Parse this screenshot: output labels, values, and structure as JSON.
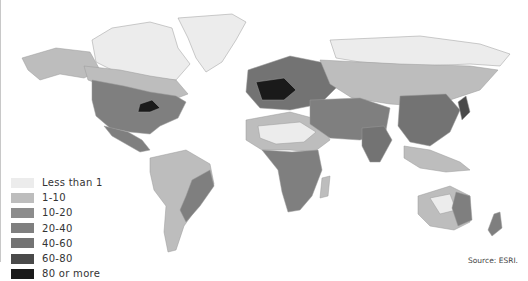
{
  "map": {
    "type": "choropleth-world-map",
    "subject": "population density"
  },
  "legend": {
    "items": [
      {
        "label": "Less than 1",
        "color": "#ececec",
        "key": "c0"
      },
      {
        "label": "1-10",
        "color": "#bdbdbd",
        "key": "c1"
      },
      {
        "label": "10-20",
        "color": "#8c8c8c",
        "key": "c2"
      },
      {
        "label": "20-40",
        "color": "#7f7f7f",
        "key": "c3"
      },
      {
        "label": "40-60",
        "color": "#737373",
        "key": "c4"
      },
      {
        "label": "60-80",
        "color": "#4a4a4a",
        "key": "c5"
      },
      {
        "label": "80 or more",
        "color": "#1a1a1a",
        "key": "c6"
      }
    ]
  },
  "regions": [
    {
      "name": "greenland",
      "class": "c0"
    },
    {
      "name": "canada-north",
      "class": "c0"
    },
    {
      "name": "alaska",
      "class": "c1"
    },
    {
      "name": "canada-south",
      "class": "c1"
    },
    {
      "name": "usa",
      "class": "c3"
    },
    {
      "name": "usa-northeast",
      "class": "c6"
    },
    {
      "name": "mexico",
      "class": "c3"
    },
    {
      "name": "south-america-amazon",
      "class": "c0"
    },
    {
      "name": "south-america",
      "class": "c1"
    },
    {
      "name": "south-america-east",
      "class": "c3"
    },
    {
      "name": "north-africa",
      "class": "c1"
    },
    {
      "name": "sahara",
      "class": "c0"
    },
    {
      "name": "central-africa",
      "class": "c3"
    },
    {
      "name": "europe",
      "class": "c4"
    },
    {
      "name": "central-europe",
      "class": "c6"
    },
    {
      "name": "russia-north",
      "class": "c0"
    },
    {
      "name": "russia-south",
      "class": "c1"
    },
    {
      "name": "middle-asia",
      "class": "c3"
    },
    {
      "name": "china-east",
      "class": "c4"
    },
    {
      "name": "india",
      "class": "c4"
    },
    {
      "name": "japan",
      "class": "c5"
    },
    {
      "name": "southeast-asia",
      "class": "c1"
    },
    {
      "name": "australia",
      "class": "c1"
    },
    {
      "name": "australia-center",
      "class": "c0"
    },
    {
      "name": "australia-east",
      "class": "c3"
    },
    {
      "name": "new-zealand",
      "class": "c3"
    },
    {
      "name": "madagascar",
      "class": "c1"
    }
  ],
  "source": "Source: ESRI."
}
